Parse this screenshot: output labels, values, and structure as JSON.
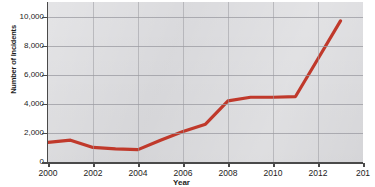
{
  "chart_data": {
    "type": "line",
    "title": "",
    "xlabel": "Year",
    "ylabel": "Number of Incidents",
    "xlim": [
      2000,
      2014
    ],
    "ylim": [
      0,
      11000
    ],
    "grid": true,
    "legend": false,
    "x_tick_labels": [
      "2000",
      "2002",
      "2004",
      "2006",
      "2008",
      "2010",
      "2012",
      "201"
    ],
    "x_tick_values": [
      2000,
      2002,
      2004,
      2006,
      2008,
      2010,
      2012,
      2014
    ],
    "y_tick_labels": [
      "0",
      "2,000",
      "4,000",
      "6,000",
      "8,000",
      "10,000"
    ],
    "y_tick_values": [
      0,
      2000,
      4000,
      6000,
      8000,
      10000
    ],
    "line_color": "#c0392b",
    "plot_background": "#d9d9dc",
    "gridline_color": "#9a9aa0",
    "axis_color": "#4a4a4a",
    "series": [
      {
        "name": "Number of Incidents",
        "x": [
          2000,
          2001,
          2002,
          2003,
          2004,
          2005,
          2006,
          2007,
          2008,
          2009,
          2010,
          2011,
          2012,
          2013
        ],
        "values": [
          1350,
          1500,
          1000,
          900,
          850,
          1500,
          2100,
          2600,
          4200,
          4450,
          4450,
          4500,
          7100,
          9700
        ]
      }
    ]
  }
}
